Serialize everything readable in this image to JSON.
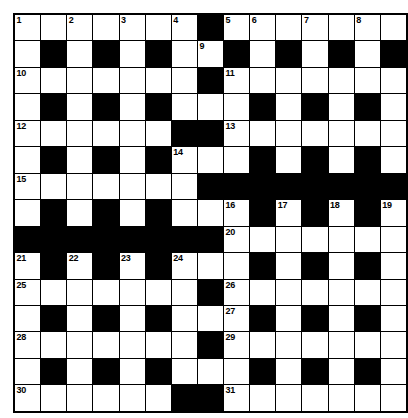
{
  "puzzle": {
    "type": "crossword-grid",
    "title": "Crossword Puzzle Grid",
    "rows": 15,
    "columns": 15,
    "colors": {
      "block": "#000000",
      "open": "#ffffff",
      "border": "#000000",
      "number_text": "#000000"
    },
    "legend": {
      "white_cell": "open letter square",
      "black_cell": "blocked square"
    },
    "clue_numbers_present": [
      1,
      2,
      3,
      4,
      5,
      6,
      7,
      8,
      9,
      10,
      11,
      12,
      13,
      14,
      15,
      16,
      17,
      18,
      19,
      20,
      21,
      22,
      23,
      24,
      25,
      26,
      27,
      28,
      29,
      30,
      31
    ],
    "grid": [
      [
        {
          "t": "w",
          "n": "1"
        },
        {
          "t": "w",
          "n": ""
        },
        {
          "t": "w",
          "n": "2"
        },
        {
          "t": "w",
          "n": ""
        },
        {
          "t": "w",
          "n": "3"
        },
        {
          "t": "w",
          "n": ""
        },
        {
          "t": "w",
          "n": "4"
        },
        {
          "t": "b",
          "n": ""
        },
        {
          "t": "w",
          "n": "5"
        },
        {
          "t": "w",
          "n": "6"
        },
        {
          "t": "w",
          "n": ""
        },
        {
          "t": "w",
          "n": "7"
        },
        {
          "t": "w",
          "n": ""
        },
        {
          "t": "w",
          "n": "8"
        },
        {
          "t": "w",
          "n": ""
        }
      ],
      [
        {
          "t": "w",
          "n": ""
        },
        {
          "t": "b",
          "n": ""
        },
        {
          "t": "w",
          "n": ""
        },
        {
          "t": "b",
          "n": ""
        },
        {
          "t": "w",
          "n": ""
        },
        {
          "t": "b",
          "n": ""
        },
        {
          "t": "w",
          "n": ""
        },
        {
          "t": "w",
          "n": "9"
        },
        {
          "t": "b",
          "n": ""
        },
        {
          "t": "w",
          "n": ""
        },
        {
          "t": "b",
          "n": ""
        },
        {
          "t": "w",
          "n": ""
        },
        {
          "t": "b",
          "n": ""
        },
        {
          "t": "w",
          "n": ""
        },
        {
          "t": "b",
          "n": ""
        }
      ],
      [
        {
          "t": "w",
          "n": "10"
        },
        {
          "t": "w",
          "n": ""
        },
        {
          "t": "w",
          "n": ""
        },
        {
          "t": "w",
          "n": ""
        },
        {
          "t": "w",
          "n": ""
        },
        {
          "t": "w",
          "n": ""
        },
        {
          "t": "w",
          "n": ""
        },
        {
          "t": "b",
          "n": ""
        },
        {
          "t": "w",
          "n": "11"
        },
        {
          "t": "w",
          "n": ""
        },
        {
          "t": "w",
          "n": ""
        },
        {
          "t": "w",
          "n": ""
        },
        {
          "t": "w",
          "n": ""
        },
        {
          "t": "w",
          "n": ""
        },
        {
          "t": "w",
          "n": ""
        }
      ],
      [
        {
          "t": "w",
          "n": ""
        },
        {
          "t": "b",
          "n": ""
        },
        {
          "t": "w",
          "n": ""
        },
        {
          "t": "b",
          "n": ""
        },
        {
          "t": "w",
          "n": ""
        },
        {
          "t": "b",
          "n": ""
        },
        {
          "t": "w",
          "n": ""
        },
        {
          "t": "w",
          "n": ""
        },
        {
          "t": "w",
          "n": ""
        },
        {
          "t": "b",
          "n": ""
        },
        {
          "t": "w",
          "n": ""
        },
        {
          "t": "b",
          "n": ""
        },
        {
          "t": "w",
          "n": ""
        },
        {
          "t": "b",
          "n": ""
        },
        {
          "t": "w",
          "n": ""
        }
      ],
      [
        {
          "t": "w",
          "n": "12"
        },
        {
          "t": "w",
          "n": ""
        },
        {
          "t": "w",
          "n": ""
        },
        {
          "t": "w",
          "n": ""
        },
        {
          "t": "w",
          "n": ""
        },
        {
          "t": "w",
          "n": ""
        },
        {
          "t": "b",
          "n": ""
        },
        {
          "t": "b",
          "n": ""
        },
        {
          "t": "w",
          "n": "13"
        },
        {
          "t": "w",
          "n": ""
        },
        {
          "t": "w",
          "n": ""
        },
        {
          "t": "w",
          "n": ""
        },
        {
          "t": "w",
          "n": ""
        },
        {
          "t": "w",
          "n": ""
        },
        {
          "t": "w",
          "n": ""
        }
      ],
      [
        {
          "t": "w",
          "n": ""
        },
        {
          "t": "b",
          "n": ""
        },
        {
          "t": "w",
          "n": ""
        },
        {
          "t": "b",
          "n": ""
        },
        {
          "t": "w",
          "n": ""
        },
        {
          "t": "b",
          "n": ""
        },
        {
          "t": "w",
          "n": "14"
        },
        {
          "t": "w",
          "n": ""
        },
        {
          "t": "w",
          "n": ""
        },
        {
          "t": "b",
          "n": ""
        },
        {
          "t": "w",
          "n": ""
        },
        {
          "t": "b",
          "n": ""
        },
        {
          "t": "w",
          "n": ""
        },
        {
          "t": "b",
          "n": ""
        },
        {
          "t": "w",
          "n": ""
        }
      ],
      [
        {
          "t": "w",
          "n": "15"
        },
        {
          "t": "w",
          "n": ""
        },
        {
          "t": "w",
          "n": ""
        },
        {
          "t": "w",
          "n": ""
        },
        {
          "t": "w",
          "n": ""
        },
        {
          "t": "w",
          "n": ""
        },
        {
          "t": "w",
          "n": ""
        },
        {
          "t": "b",
          "n": ""
        },
        {
          "t": "b",
          "n": ""
        },
        {
          "t": "b",
          "n": ""
        },
        {
          "t": "b",
          "n": ""
        },
        {
          "t": "b",
          "n": ""
        },
        {
          "t": "b",
          "n": ""
        },
        {
          "t": "b",
          "n": ""
        },
        {
          "t": "b",
          "n": ""
        }
      ],
      [
        {
          "t": "w",
          "n": ""
        },
        {
          "t": "b",
          "n": ""
        },
        {
          "t": "w",
          "n": ""
        },
        {
          "t": "b",
          "n": ""
        },
        {
          "t": "w",
          "n": ""
        },
        {
          "t": "b",
          "n": ""
        },
        {
          "t": "w",
          "n": ""
        },
        {
          "t": "w",
          "n": ""
        },
        {
          "t": "w",
          "n": "16"
        },
        {
          "t": "b",
          "n": ""
        },
        {
          "t": "w",
          "n": "17"
        },
        {
          "t": "b",
          "n": ""
        },
        {
          "t": "w",
          "n": "18"
        },
        {
          "t": "b",
          "n": ""
        },
        {
          "t": "w",
          "n": "19"
        }
      ],
      [
        {
          "t": "b",
          "n": ""
        },
        {
          "t": "b",
          "n": ""
        },
        {
          "t": "b",
          "n": ""
        },
        {
          "t": "b",
          "n": ""
        },
        {
          "t": "b",
          "n": ""
        },
        {
          "t": "b",
          "n": ""
        },
        {
          "t": "b",
          "n": ""
        },
        {
          "t": "b",
          "n": ""
        },
        {
          "t": "w",
          "n": "20"
        },
        {
          "t": "w",
          "n": ""
        },
        {
          "t": "w",
          "n": ""
        },
        {
          "t": "w",
          "n": ""
        },
        {
          "t": "w",
          "n": ""
        },
        {
          "t": "w",
          "n": ""
        },
        {
          "t": "w",
          "n": ""
        }
      ],
      [
        {
          "t": "w",
          "n": "21"
        },
        {
          "t": "b",
          "n": ""
        },
        {
          "t": "w",
          "n": "22"
        },
        {
          "t": "b",
          "n": ""
        },
        {
          "t": "w",
          "n": "23"
        },
        {
          "t": "b",
          "n": ""
        },
        {
          "t": "w",
          "n": "24"
        },
        {
          "t": "w",
          "n": ""
        },
        {
          "t": "w",
          "n": ""
        },
        {
          "t": "b",
          "n": ""
        },
        {
          "t": "w",
          "n": ""
        },
        {
          "t": "b",
          "n": ""
        },
        {
          "t": "w",
          "n": ""
        },
        {
          "t": "b",
          "n": ""
        },
        {
          "t": "w",
          "n": ""
        }
      ],
      [
        {
          "t": "w",
          "n": "25"
        },
        {
          "t": "w",
          "n": ""
        },
        {
          "t": "w",
          "n": ""
        },
        {
          "t": "w",
          "n": ""
        },
        {
          "t": "w",
          "n": ""
        },
        {
          "t": "w",
          "n": ""
        },
        {
          "t": "w",
          "n": ""
        },
        {
          "t": "b",
          "n": ""
        },
        {
          "t": "w",
          "n": "26"
        },
        {
          "t": "w",
          "n": ""
        },
        {
          "t": "w",
          "n": ""
        },
        {
          "t": "w",
          "n": ""
        },
        {
          "t": "w",
          "n": ""
        },
        {
          "t": "w",
          "n": ""
        },
        {
          "t": "w",
          "n": ""
        }
      ],
      [
        {
          "t": "w",
          "n": ""
        },
        {
          "t": "b",
          "n": ""
        },
        {
          "t": "w",
          "n": ""
        },
        {
          "t": "b",
          "n": ""
        },
        {
          "t": "w",
          "n": ""
        },
        {
          "t": "b",
          "n": ""
        },
        {
          "t": "w",
          "n": ""
        },
        {
          "t": "w",
          "n": ""
        },
        {
          "t": "w",
          "n": "27"
        },
        {
          "t": "b",
          "n": ""
        },
        {
          "t": "w",
          "n": ""
        },
        {
          "t": "b",
          "n": ""
        },
        {
          "t": "w",
          "n": ""
        },
        {
          "t": "b",
          "n": ""
        },
        {
          "t": "w",
          "n": ""
        }
      ],
      [
        {
          "t": "w",
          "n": "28"
        },
        {
          "t": "w",
          "n": ""
        },
        {
          "t": "w",
          "n": ""
        },
        {
          "t": "w",
          "n": ""
        },
        {
          "t": "w",
          "n": ""
        },
        {
          "t": "w",
          "n": ""
        },
        {
          "t": "w",
          "n": ""
        },
        {
          "t": "b",
          "n": ""
        },
        {
          "t": "w",
          "n": "29"
        },
        {
          "t": "w",
          "n": ""
        },
        {
          "t": "w",
          "n": ""
        },
        {
          "t": "w",
          "n": ""
        },
        {
          "t": "w",
          "n": ""
        },
        {
          "t": "w",
          "n": ""
        },
        {
          "t": "w",
          "n": ""
        }
      ],
      [
        {
          "t": "w",
          "n": ""
        },
        {
          "t": "b",
          "n": ""
        },
        {
          "t": "w",
          "n": ""
        },
        {
          "t": "b",
          "n": ""
        },
        {
          "t": "w",
          "n": ""
        },
        {
          "t": "b",
          "n": ""
        },
        {
          "t": "w",
          "n": ""
        },
        {
          "t": "w",
          "n": ""
        },
        {
          "t": "w",
          "n": ""
        },
        {
          "t": "b",
          "n": ""
        },
        {
          "t": "w",
          "n": ""
        },
        {
          "t": "b",
          "n": ""
        },
        {
          "t": "w",
          "n": ""
        },
        {
          "t": "b",
          "n": ""
        },
        {
          "t": "w",
          "n": ""
        }
      ],
      [
        {
          "t": "w",
          "n": "30"
        },
        {
          "t": "w",
          "n": ""
        },
        {
          "t": "w",
          "n": ""
        },
        {
          "t": "w",
          "n": ""
        },
        {
          "t": "w",
          "n": ""
        },
        {
          "t": "w",
          "n": ""
        },
        {
          "t": "b",
          "n": ""
        },
        {
          "t": "b",
          "n": ""
        },
        {
          "t": "w",
          "n": "31"
        },
        {
          "t": "w",
          "n": ""
        },
        {
          "t": "w",
          "n": ""
        },
        {
          "t": "w",
          "n": ""
        },
        {
          "t": "w",
          "n": ""
        },
        {
          "t": "w",
          "n": ""
        },
        {
          "t": "w",
          "n": ""
        }
      ]
    ]
  }
}
